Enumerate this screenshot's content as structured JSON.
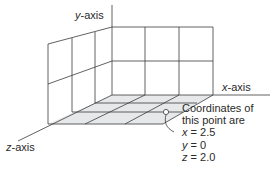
{
  "axes": {
    "y": {
      "var": "y",
      "suffix": "-axis"
    },
    "x": {
      "var": "x",
      "suffix": "-axis"
    },
    "z": {
      "var": "z",
      "suffix": "-axis"
    }
  },
  "annotation": {
    "line1": "Coordinates of",
    "line2": "this point are",
    "coords": [
      {
        "var": "x",
        "value": " = 2.5"
      },
      {
        "var": "y",
        "value": " = 0"
      },
      {
        "var": "z",
        "value": " = 2.0"
      }
    ]
  },
  "colors": {
    "line": "#3a3a3a",
    "floor_fill": "#e6e8ea",
    "text": "#2a2a2a"
  },
  "point": {
    "x": 2.5,
    "y": 0,
    "z": 2.0
  }
}
